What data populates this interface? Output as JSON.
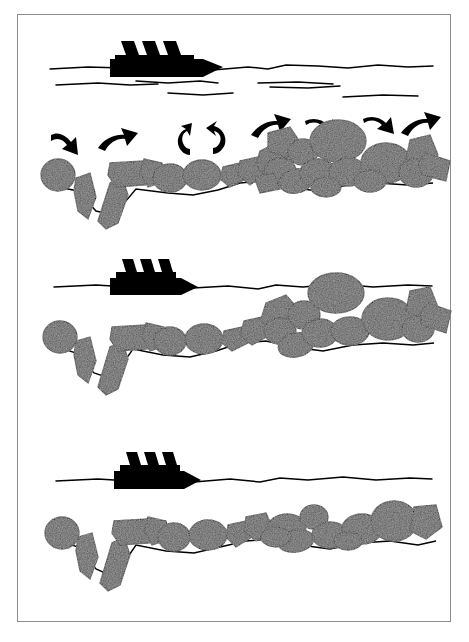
{
  "figure": {
    "type": "three-stage sequential cross-section sketch",
    "background_color": "#ffffff",
    "border_color": "#8d8d8d",
    "ink_color": "#000000",
    "rock_fill_color": "#555555",
    "rock_texture": "stippled-speckle",
    "ship_color": "#000000",
    "panel_count": 3
  },
  "panels": [
    {
      "id": "panel-a",
      "name": "stage-1-initial-berm-with-agitation",
      "stage_label": "1",
      "description": "Ship at the surface generating waves; curved motion arrows show rocks being lifted, rolled and transported along an irregular berm with a deep V-shaped scour trench at the left",
      "has_ship": true,
      "has_arrows": true,
      "has_wave_ripples": true,
      "wave_ripple_count": 6,
      "arrow_count": 8,
      "rock_count": 24,
      "berm_profile": "steep, high crest on the right, deep trench on the left"
    },
    {
      "id": "panel-b",
      "name": "stage-2-partially-reworked-berm",
      "stage_label": "2",
      "description": "Same cross-section without motion arrows; the right-hand rock pile has been reworked and now rises to the waterline, the surface is a single smooth wavy line",
      "has_ship": true,
      "has_arrows": false,
      "has_wave_ripples": false,
      "wave_ripple_count": 0,
      "arrow_count": 0,
      "rock_count": 20,
      "berm_profile": "lowered crest, rocks intersecting the waterline"
    },
    {
      "id": "panel-c",
      "name": "stage-3-flattened-dispersed-berm",
      "stage_label": "3",
      "description": "Final stage; rocks are dispersed into a thin single layer spread along the seabed, the berm crest has been removed entirely",
      "has_ship": true,
      "has_arrows": false,
      "has_wave_ripples": false,
      "wave_ripple_count": 0,
      "arrow_count": 0,
      "rock_count": 18,
      "berm_profile": "flat, single-layer armour spread"
    }
  ],
  "elements": {
    "ship": {
      "name": "ship-silhouette",
      "funnel_count": 3,
      "color": "#000000",
      "description": "solid black profile of a vessel with three angled funnels and a raked bow"
    },
    "waterline": {
      "name": "water-surface-line",
      "style": "hand-drawn irregular horizontal stroke"
    },
    "seabed": {
      "name": "seabed-line",
      "style": "thin irregular line beneath the rocks"
    },
    "arrows": [
      {
        "name": "arrow-down-right",
        "direction": "down-right",
        "glyph": "curved"
      },
      {
        "name": "arrow-up-right",
        "direction": "up-right",
        "glyph": "curved"
      },
      {
        "name": "arrow-rotate-ccw",
        "direction": "counter-clockwise",
        "glyph": "rotation"
      },
      {
        "name": "arrow-rotate-cw",
        "direction": "clockwise",
        "glyph": "rotation"
      },
      {
        "name": "arrow-up-right-2",
        "direction": "up-right",
        "glyph": "curved"
      },
      {
        "name": "arrow-right-down",
        "direction": "right-down",
        "glyph": "curved"
      },
      {
        "name": "arrow-right-down-2",
        "direction": "right-down",
        "glyph": "curved"
      },
      {
        "name": "arrow-up-right-3",
        "direction": "up-right",
        "glyph": "curved"
      }
    ]
  }
}
